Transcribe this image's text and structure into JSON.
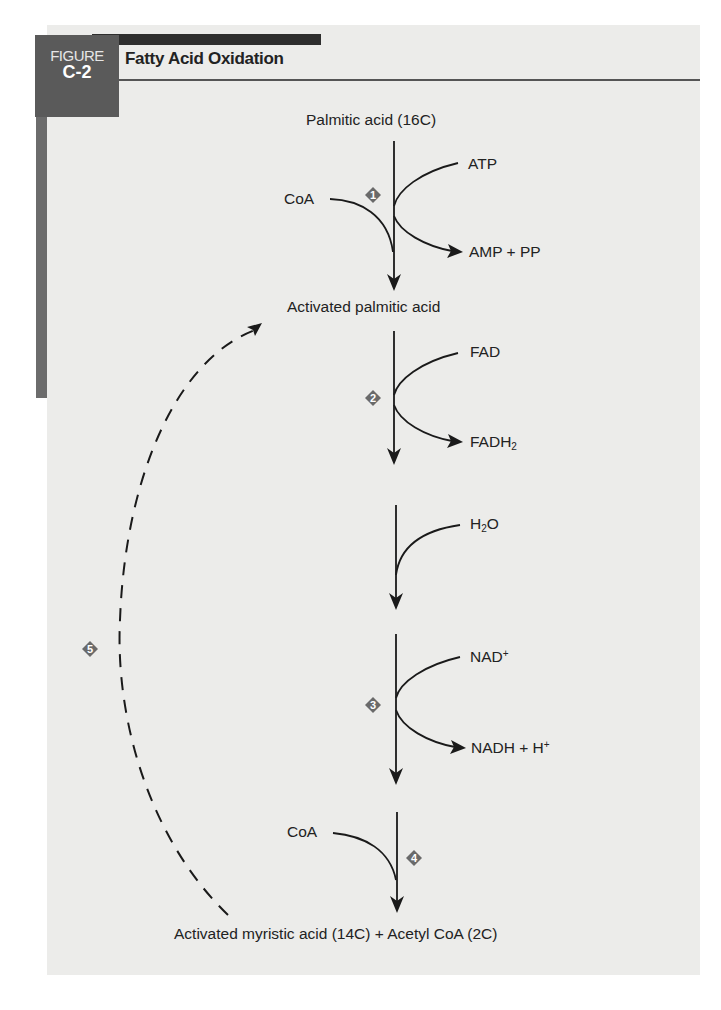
{
  "figure": {
    "label_word": "FIGURE",
    "label_number": "C-2",
    "title": "Fatty Acid Oxidation"
  },
  "compounds": {
    "palmitic_acid": "Palmitic acid (16C)",
    "activated_palmitic_acid": "Activated palmitic acid",
    "final_products": "Activated myristic acid (14C) + Acetyl CoA (2C)"
  },
  "cofactors": {
    "step1_in_left": "CoA",
    "step1_in_right": "ATP",
    "step1_out": "AMP + PP",
    "step2_in": "FAD",
    "step2_out_base": "FADH",
    "step2_out_sub": "2",
    "hydration_in_base": "H",
    "hydration_in_sub": "2",
    "hydration_in_tail": "O",
    "step3_in_base": "NAD",
    "step3_in_sup": "+",
    "step3_out_base": "NADH + H",
    "step3_out_sup": "+",
    "step4_in": "CoA"
  },
  "steps": [
    {
      "number": "1"
    },
    {
      "number": "2"
    },
    {
      "number": "3"
    },
    {
      "number": "4"
    },
    {
      "number": "5"
    }
  ],
  "colors": {
    "panel_bg": "#ececea",
    "label_box": "#5a5a5a",
    "top_bar": "#2e2e2e",
    "side_bar": "#6c6c6c",
    "step_marker": "#6a6a6a",
    "line": "#1a1a1a"
  }
}
